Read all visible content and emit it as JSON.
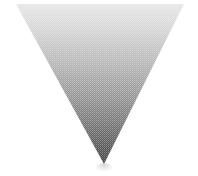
{
  "canvas": {
    "width": 198,
    "height": 176,
    "background_color": "#ffffff",
    "alt_text": "Inverted triangle with vertical grayscale gradient"
  },
  "figure": {
    "name": "inverted-triangle",
    "shape_type": "triangle-down",
    "vertices": [
      {
        "label": "top-left",
        "x": 16,
        "y": 4
      },
      {
        "label": "top-right",
        "x": 184,
        "y": 4
      },
      {
        "label": "bottom-apex",
        "x": 104,
        "y": 164
      }
    ],
    "fill_style": "linear-gradient-vertical",
    "gradient": {
      "direction": "top-to-bottom",
      "stops": [
        {
          "offset": "0%",
          "color": "#e6e6e6"
        },
        {
          "offset": "18%",
          "color": "#d2d2d2"
        },
        {
          "offset": "38%",
          "color": "#b4b4b4"
        },
        {
          "offset": "58%",
          "color": "#949494"
        },
        {
          "offset": "78%",
          "color": "#6e6e6e"
        },
        {
          "offset": "100%",
          "color": "#3f3f3f"
        }
      ]
    },
    "texture": {
      "name": "halftone-dither",
      "description": "ordered dither / halftone screen overlay",
      "dot_pitch_px": 2,
      "dot_color": "#ffffff",
      "strength": 0.3
    },
    "outline": "none"
  },
  "shadow": {
    "name": "apex-shadow",
    "visible": true,
    "center_x": 104,
    "top_y": 163,
    "width": 18,
    "height": 11,
    "color": "#d8d8d8",
    "opacity": 0.55
  },
  "palette": {
    "lightest": "#e6e6e6",
    "midtone": "#949494",
    "darkest": "#3f3f3f",
    "background": "#ffffff"
  }
}
